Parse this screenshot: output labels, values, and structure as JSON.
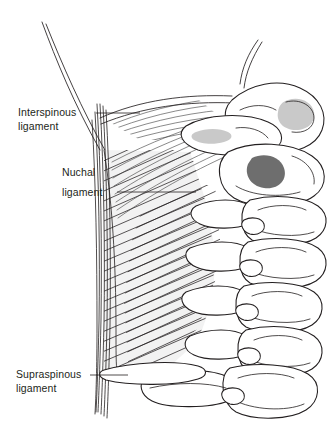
{
  "figure": {
    "background_color": "#ffffff",
    "ink_color": "#231f20"
  },
  "labels": [
    {
      "id": "interspinous",
      "line1": "Interspinous",
      "line2": "ligament",
      "text_x": 18,
      "text_y": 116,
      "leader": {
        "x1": 96,
        "y1": 113,
        "x2": 140,
        "y2": 113
      }
    },
    {
      "id": "nuchal",
      "line1": "Nuchal",
      "line2": "ligament",
      "text_x": 62,
      "text_y": 176,
      "leader": {
        "x1": 117,
        "y1": 192,
        "x2": 196,
        "y2": 192
      }
    },
    {
      "id": "supraspinous",
      "line1": "Supraspinous",
      "line2": "ligament",
      "text_x": 16,
      "text_y": 378,
      "leader": {
        "x1": 90,
        "y1": 375,
        "x2": 128,
        "y2": 375
      }
    }
  ],
  "structures": {
    "supraspinous_band": "vertical-fiber-band-left-margin",
    "nuchal_sheet": "hatched-triangular-sheet",
    "occiput": "occipital-bone-upper-right",
    "vertebrae": [
      "atlas-C1",
      "axis-C2",
      "C3",
      "C4",
      "C5",
      "C6",
      "C7"
    ],
    "foramen": "dark-vertebral-foramen"
  },
  "colors": {
    "ink": "#231f20",
    "bone_fill": "#ffffff",
    "shade_light": "#e2e2e2",
    "shade_mid": "#c9c9c9",
    "shade_dark": "#6e6e6e",
    "ligament_tint": "#f2f2f2"
  }
}
